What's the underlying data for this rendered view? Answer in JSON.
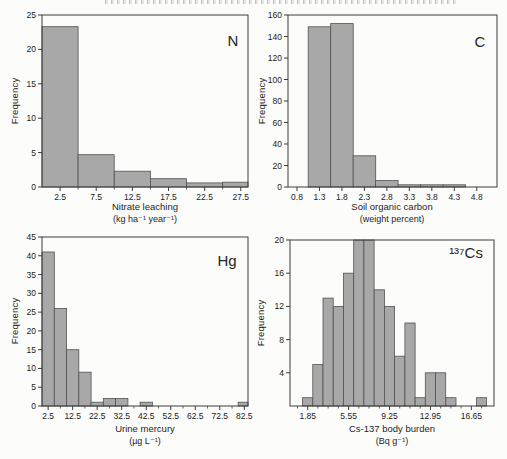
{
  "figure": {
    "background": "#fcfcfb",
    "bar_fill": "#a8a8a8",
    "bar_stroke": "#525252",
    "frame_color": "#3c3c3c",
    "text_color": "#222222"
  },
  "chart_data": [
    {
      "id": "nitrate_leaching",
      "type": "bar",
      "panel_label": "N",
      "xlabel": "Nitrate leaching",
      "xlabel_unit": "(kg ha⁻¹ year⁻¹)",
      "ylabel": "Frequency",
      "xlim": [
        0,
        28.5
      ],
      "ylim": [
        0,
        25
      ],
      "bin_width": 5,
      "bin_centers": [
        2.5,
        7.5,
        12.5,
        17.5,
        22.5,
        27.5
      ],
      "values": [
        23.3,
        4.7,
        2.3,
        1.2,
        0.6,
        0.7
      ],
      "xticks": [
        2.5,
        7.5,
        12.5,
        17.5,
        22.5,
        27.5
      ],
      "xtick_labels": [
        "2.5",
        "7.5",
        "12.5",
        "17.5",
        "22.5",
        "27.5"
      ],
      "xminor": [
        5,
        10,
        15,
        20,
        25
      ],
      "yticks": [
        0,
        5,
        10,
        15,
        20,
        25
      ],
      "ytick_labels": [
        "0",
        "5",
        "10",
        "15",
        "20",
        "25"
      ],
      "grid": false
    },
    {
      "id": "soil_organic_carbon",
      "type": "bar",
      "panel_label": "C",
      "xlabel": "Soil organic carbon",
      "xlabel_unit": "(weight percent)",
      "ylabel": "Frequency",
      "xlim": [
        0.6,
        5.25
      ],
      "ylim": [
        0,
        160
      ],
      "bin_width": 0.5,
      "bin_centers": [
        1.3,
        1.8,
        2.3,
        2.8,
        3.3,
        3.8,
        4.3
      ],
      "values": [
        149,
        152,
        29,
        6,
        2,
        2,
        2
      ],
      "xticks": [
        0.8,
        1.3,
        1.8,
        2.3,
        2.8,
        3.3,
        3.8,
        4.3,
        4.8
      ],
      "xtick_labels": [
        "0.8",
        "1.3",
        "1.8",
        "2.3",
        "2.8",
        "3.3",
        "3.8",
        "4.3",
        "4.8"
      ],
      "xminor": [],
      "yticks": [
        0,
        20,
        40,
        60,
        80,
        100,
        120,
        140,
        160
      ],
      "ytick_labels": [
        "0",
        "20",
        "40",
        "60",
        "80",
        "100",
        "120",
        "140",
        "160"
      ],
      "grid": false
    },
    {
      "id": "urine_mercury",
      "type": "bar",
      "panel_label": "Hg",
      "xlabel": "Urine mercury",
      "xlabel_unit": "(µg L⁻¹)",
      "ylabel": "Frequency",
      "xlim": [
        0,
        84
      ],
      "ylim": [
        0,
        45
      ],
      "bin_width": 5,
      "bin_centers": [
        2.5,
        7.5,
        12.5,
        17.5,
        22.5,
        27.5,
        32.5,
        37.5,
        42.5,
        47.5,
        52.5,
        57.5,
        62.5,
        67.5,
        72.5,
        77.5,
        82.5
      ],
      "values": [
        41,
        26,
        15,
        9,
        1,
        2,
        2,
        0,
        1,
        0,
        0,
        0,
        0,
        0,
        0,
        0,
        1
      ],
      "xticks": [
        2.5,
        12.5,
        22.5,
        32.5,
        42.5,
        52.5,
        62.5,
        72.5,
        82.5
      ],
      "xtick_labels": [
        "2.5",
        "12.5",
        "22.5",
        "32.5",
        "42.5",
        "52.5",
        "62.5",
        "72.5",
        "82.5"
      ],
      "xminor": [
        7.5,
        17.5,
        27.5,
        37.5,
        47.5,
        57.5,
        67.5,
        77.5
      ],
      "yticks": [
        0,
        5,
        10,
        15,
        20,
        25,
        30,
        35,
        40,
        45
      ],
      "ytick_labels": [
        "0",
        "5",
        "10",
        "15",
        "20",
        "25",
        "30",
        "35",
        "40",
        "45"
      ],
      "grid": false
    },
    {
      "id": "cs137_body_burden",
      "type": "bar",
      "panel_label": "¹³⁷Cs",
      "xlabel": "Cs-137 body burden",
      "xlabel_unit": "(Bq g⁻¹)",
      "ylabel": "Frequency",
      "xlim": [
        0.25,
        18.7
      ],
      "ylim": [
        0,
        20
      ],
      "bin_width": 0.925,
      "bin_centers": [
        1.85,
        2.775,
        3.7,
        4.625,
        5.55,
        6.475,
        7.4,
        8.325,
        9.25,
        10.175,
        11.1,
        12.025,
        12.95,
        13.875,
        14.8,
        15.725,
        16.65,
        17.575
      ],
      "values": [
        1,
        5,
        13,
        12,
        16,
        20,
        20,
        14,
        12,
        6,
        10,
        1,
        4,
        4,
        1,
        0,
        0,
        1
      ],
      "xticks": [
        1.85,
        5.55,
        9.25,
        12.95,
        16.65
      ],
      "xtick_labels": [
        "1.85",
        "5.55",
        "9.25",
        "12.95",
        "16.65"
      ],
      "xminor": [
        0.925,
        2.775,
        3.7,
        4.625,
        6.475,
        7.4,
        8.325,
        10.175,
        11.1,
        12.025,
        13.875,
        14.8,
        15.725,
        17.575
      ],
      "yticks": [
        4,
        8,
        12,
        16,
        20
      ],
      "ytick_labels": [
        "4",
        "8",
        "12",
        "16",
        "20"
      ],
      "grid": false
    }
  ]
}
